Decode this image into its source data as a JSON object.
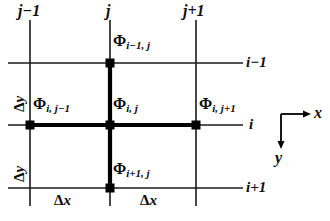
{
  "figure": {
    "colors": {
      "line": "#1a1a1a",
      "bold_line": "#000000",
      "node": "#000000",
      "text": "#0d0d0d",
      "background": "#ffffff"
    }
  },
  "column_labels": [
    {
      "text": "j−1",
      "x": 18,
      "y": 4
    },
    {
      "text": "j",
      "x": 106,
      "y": 4
    },
    {
      "text": "j+1",
      "x": 183,
      "y": 4
    }
  ],
  "row_labels": [
    {
      "text": "i−1",
      "x": 246,
      "y": 54
    },
    {
      "text": "i",
      "x": 248,
      "y": 117
    },
    {
      "text": "i+1",
      "x": 246,
      "y": 180
    }
  ],
  "nodes": [
    {
      "name": "phi-i-minus-1-j",
      "base": "Φ",
      "sub": "i−1, j",
      "label_x": 113,
      "label_y": 34,
      "cx": 110,
      "cy": 63
    },
    {
      "name": "phi-i-j-minus-1",
      "base": "Φ",
      "sub": "i, j−1",
      "label_x": 33,
      "label_y": 97,
      "cx": 30,
      "cy": 125
    },
    {
      "name": "phi-i-j",
      "base": "Φ",
      "sub": "i, j",
      "label_x": 113,
      "label_y": 97,
      "cx": 110,
      "cy": 125
    },
    {
      "name": "phi-i-j-plus-1",
      "base": "Φ",
      "sub": "i, j+1",
      "label_x": 199,
      "label_y": 97,
      "cx": 196,
      "cy": 125
    },
    {
      "name": "phi-i-plus-1-j",
      "base": "Φ",
      "sub": "i+1, j",
      "label_x": 113,
      "label_y": 162,
      "cx": 110,
      "cy": 188
    }
  ],
  "spacing_labels": {
    "delta_y_upper": {
      "symbol": "Δ",
      "var": "y",
      "x": 11,
      "y": 108
    },
    "delta_y_lower": {
      "symbol": "Δ",
      "var": "y",
      "x": 11,
      "y": 178
    },
    "delta_x_left": {
      "symbol": "Δ",
      "var": "x",
      "x": 56,
      "y": 193
    },
    "delta_x_right": {
      "symbol": "Δ",
      "var": "x",
      "x": 142,
      "y": 193
    }
  },
  "axes": {
    "origin_x": 281,
    "origin_y": 114,
    "x_label": "x",
    "x_label_pos": {
      "x": 314,
      "y": 106
    },
    "y_label": "y",
    "y_label_pos": {
      "x": 274,
      "y": 152
    },
    "x_arrow_end": 307,
    "y_arrow_end": 145
  },
  "grid": {
    "vertical_lines_x": [
      30,
      110,
      196
    ],
    "vertical_line_top": 20,
    "vertical_line_bottom": 206,
    "horizontal_lines_y": [
      63,
      125,
      188
    ],
    "horizontal_line_left": 8,
    "horizontal_line_right": 243,
    "stencil_vertical_x": 110,
    "stencil_vertical_top": 63,
    "stencil_vertical_bottom": 188,
    "stencil_horizontal_y": 125,
    "stencil_horizontal_left": 30,
    "stencil_horizontal_right": 196,
    "thin_width": 1.4,
    "bold_width": 4,
    "node_size": 9
  }
}
